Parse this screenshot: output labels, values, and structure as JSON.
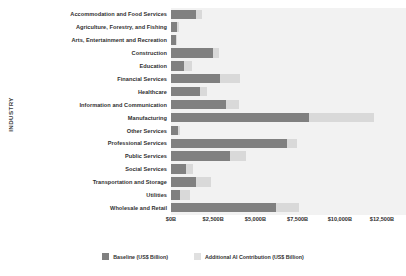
{
  "chart_data": {
    "type": "bar",
    "orientation": "horizontal",
    "stacked": true,
    "title": "",
    "xlabel": "",
    "ylabel": "INDUSTRY",
    "xlim": [
      0,
      12500
    ],
    "xticks": [
      "$0B",
      "$2,500B",
      "$5,000B",
      "$7,500B",
      "$10,000B",
      "$12,500B"
    ],
    "xtick_values": [
      0,
      2500,
      5000,
      7500,
      10000,
      12500
    ],
    "grid": false,
    "legend_position": "bottom-center",
    "categories": [
      "Accommodation and Food Services",
      "Agriculture, Forestry, and Fishing",
      "Arts, Entertainment and Recreation",
      "Construction",
      "Education",
      "Financial Services",
      "Healthcare",
      "Information and Communication",
      "Manufacturing",
      "Other Services",
      "Professional Services",
      "Public Services",
      "Social Services",
      "Transportation and Storage",
      "Utilities",
      "Wholesale and Retail"
    ],
    "series": [
      {
        "name": "Baseline (US$ Billion)",
        "color": "#808080",
        "values": [
          1470,
          350,
          290,
          2470,
          760,
          2880,
          1710,
          3230,
          8180,
          410,
          6880,
          3470,
          880,
          1470,
          530,
          6230
        ]
      },
      {
        "name": "Additional AI Contribution (US$ Billion)",
        "color": "#d9d9d9",
        "values": [
          350,
          120,
          60,
          350,
          470,
          1180,
          410,
          820,
          3820,
          120,
          590,
          1000,
          410,
          880,
          590,
          1350
        ]
      }
    ]
  },
  "legend": {
    "items": [
      {
        "label": "Baseline (US$ Billion)",
        "swatch": "base-swatch"
      },
      {
        "label": "Additional AI Contribution (US$ Billion)",
        "swatch": "ai-swatch"
      }
    ]
  },
  "axis": {
    "y_title": "INDUSTRY"
  }
}
